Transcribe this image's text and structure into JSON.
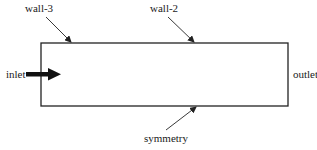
{
  "diagram": {
    "type": "boundary-conditions-schematic",
    "domain_box": {
      "x": 41,
      "y": 43,
      "width": 247,
      "height": 63,
      "stroke": "#222222"
    },
    "labels": {
      "wall3": "wall-3",
      "wall2": "wall-2",
      "inlet": "inlet",
      "outlet": "outlet",
      "symmetry": "symmetry"
    },
    "colors": {
      "line": "#222222",
      "text": "#1a1a1a",
      "background": "#ffffff"
    }
  }
}
